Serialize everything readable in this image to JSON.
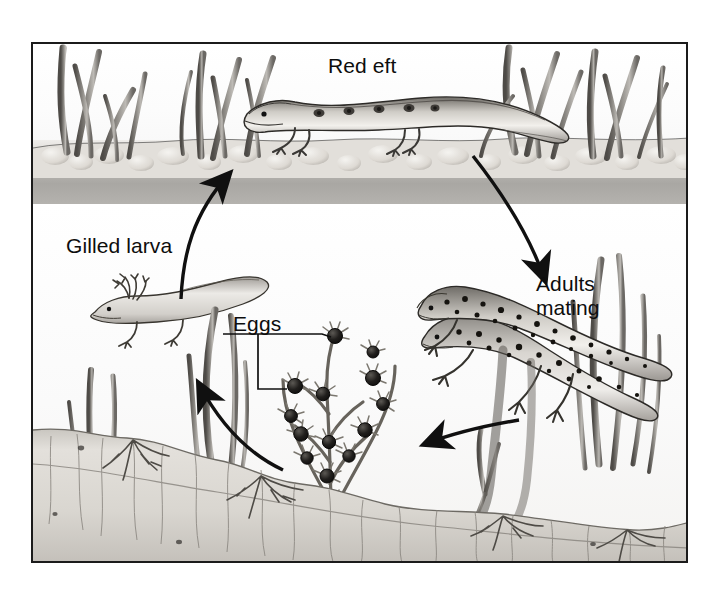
{
  "figure": {
    "frame_border_color": "#1b1b1b",
    "background_color": "#ffffff",
    "style": "pencil / graphite scientific illustration, grayscale"
  },
  "labels": {
    "red_eft": "Red eft",
    "gilled_larva": "Gilled larva",
    "eggs": "Eggs",
    "adults_mating_line1": "Adults",
    "adults_mating_line2": "mating"
  },
  "stages": [
    {
      "id": "red-eft",
      "label": "Red eft",
      "habitat": "land",
      "position": "top-center"
    },
    {
      "id": "adults-mating",
      "label": "Adults mating",
      "habitat": "water",
      "position": "right"
    },
    {
      "id": "eggs",
      "label": "Eggs",
      "habitat": "water",
      "position": "bottom-center"
    },
    {
      "id": "gilled-larva",
      "label": "Gilled larva",
      "habitat": "water",
      "position": "left"
    }
  ],
  "arrows": [
    {
      "id": "larva-to-eft",
      "from": "gilled-larva",
      "to": "red-eft",
      "direction": "up-right"
    },
    {
      "id": "eft-to-adults",
      "from": "red-eft",
      "to": "adults-mating",
      "direction": "down-right"
    },
    {
      "id": "adults-to-eggs",
      "from": "adults-mating",
      "to": "eggs",
      "direction": "down-left"
    },
    {
      "id": "eggs-to-larva",
      "from": "eggs",
      "to": "gilled-larva",
      "direction": "up-left"
    }
  ],
  "scene": {
    "shore_grass_left": 5,
    "shore_grass_right": 6,
    "aquatic_plants": 3,
    "egg_count_visible": 14,
    "substrate": "sand with plant roots"
  },
  "colors": {
    "ink": "#101010",
    "frame": "#1b1b1b",
    "bank": "#d6d3ce",
    "water_surface": "#aca9a5",
    "water": "#fbfbfa",
    "sand": "#e6e3de",
    "label_text": "#0d0d0d"
  }
}
